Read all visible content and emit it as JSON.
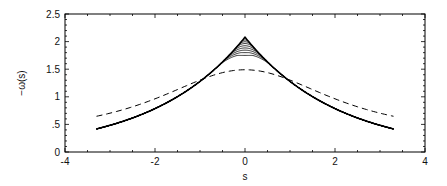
{
  "chart_data": {
    "type": "line",
    "title": "",
    "xlabel": "s",
    "ylabel": "−ω(s)",
    "xlim": [
      -4,
      4
    ],
    "ylim": [
      0,
      2.5
    ],
    "xticks": [
      -4,
      -2,
      0,
      2,
      4
    ],
    "xtick_labels": [
      "-4",
      "-2",
      "0",
      "2",
      "4"
    ],
    "yticks": [
      0,
      0.5,
      1,
      1.5,
      2,
      2.5
    ],
    "ytick_labels": [
      "0",
      ".5",
      "1",
      "1.5",
      "2",
      "2.5"
    ],
    "grid": false,
    "legend": null,
    "series": [
      {
        "name": "solid family (sharpening peak)",
        "style": "solid",
        "color": "#000000",
        "note": "family of ~8 nearly overlapping solid curves, diverging only near s=0; peaks range from ~1.75 to ~2.08",
        "x": [
          -3.3,
          -3.0,
          -2.5,
          -2.0,
          -1.5,
          -1.0,
          -0.5,
          -0.25,
          0,
          0.25,
          0.5,
          1.0,
          1.5,
          2.0,
          2.5,
          3.0,
          3.3
        ],
        "peaks": [
          1.75,
          1.8,
          1.85,
          1.9,
          1.95,
          2.0,
          2.04,
          2.08
        ],
        "values": [
          0.45,
          0.5,
          0.62,
          0.8,
          1.03,
          1.3,
          1.6,
          1.8,
          2.08,
          1.8,
          1.6,
          1.3,
          1.03,
          0.8,
          0.62,
          0.5,
          0.45
        ]
      },
      {
        "name": "dashed (smooth)",
        "style": "dashed",
        "color": "#000000",
        "x": [
          -3.3,
          -3.0,
          -2.5,
          -2.0,
          -1.5,
          -1.0,
          -0.5,
          0,
          0.5,
          1.0,
          1.5,
          2.0,
          2.5,
          3.0,
          3.3
        ],
        "values": [
          0.5,
          0.56,
          0.7,
          0.87,
          1.08,
          1.28,
          1.44,
          1.49,
          1.44,
          1.28,
          1.08,
          0.87,
          0.7,
          0.56,
          0.5
        ]
      }
    ]
  }
}
